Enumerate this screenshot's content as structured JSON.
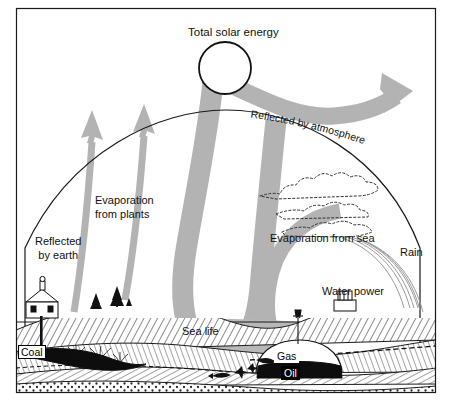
{
  "figure": {
    "kind": "energy-flow-diagram",
    "background_color": "#ffffff",
    "ink_color": "#111111",
    "beam_color": "#b3b3b3",
    "sea_color": "#b8b8b8",
    "frame_color": "#1a1a1a"
  },
  "labels": {
    "total_solar_energy": "Total solar energy",
    "reflected_by_atmosphere": "Reflected by atmosphere",
    "reflected_by_earth": "Reflected\nby earth",
    "reflected_by_earth_line1": "Reflected",
    "reflected_by_earth_line2": "by earth",
    "evaporation_from_plants_line1": "Evaporation",
    "evaporation_from_plants_line2": "from plants",
    "evaporation_from_sea": "Evaporation from sea",
    "rain": "Rain",
    "water_power": "Water power",
    "sea_life": "Sea life",
    "coal": "Coal",
    "gas": "Gas",
    "oil": "Oil"
  },
  "icons": {
    "sun": "sun-circle-icon",
    "cloud": "cloud-icon",
    "rain": "rain-streaks-icon",
    "mine_building": "mine-headframe-building-icon",
    "dam": "dam-powerhouse-icon",
    "derrick": "oil-derrick-icon",
    "trees": "tree-icon",
    "coral": "coral-icon",
    "fish": "fish-icon"
  },
  "flows": [
    {
      "name": "total-solar-energy-beam",
      "from": "sun",
      "to": "sea",
      "style": "thick-gray-band"
    },
    {
      "name": "reflected-by-atmosphere-arrow",
      "from": "sun",
      "to": "space",
      "style": "curved-arrow-right"
    },
    {
      "name": "reflected-by-earth-arrow",
      "from": "earth",
      "to": "space",
      "style": "slim-arrow-up"
    },
    {
      "name": "evaporation-from-plants-arrow",
      "from": "plants",
      "to": "space",
      "style": "slim-arrow-up"
    },
    {
      "name": "evaporation-from-sea-band",
      "from": "sea",
      "to": "clouds",
      "style": "thick-gray-band"
    },
    {
      "name": "rain-streaks",
      "from": "clouds",
      "to": "land",
      "style": "fine-streaks"
    }
  ]
}
